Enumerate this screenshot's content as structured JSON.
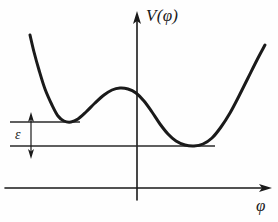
{
  "figure": {
    "background_color": "#fefefe",
    "ink_color": "#1a1a1a",
    "width": 278,
    "height": 222
  },
  "labels": {
    "y_axis": "V(φ)",
    "x_axis": "φ",
    "epsilon": "ε"
  },
  "icons": {
    "y_axis_arrow": "arrow-up-icon",
    "x_axis_arrow": "arrow-right-icon",
    "epsilon_arrow_top": "arrow-up-icon",
    "epsilon_arrow_bottom": "arrow-down-icon"
  },
  "chart_data": {
    "type": "line",
    "title": "",
    "xlabel": "φ",
    "ylabel": "V(φ)",
    "grid": false,
    "legend": null,
    "axes": {
      "origin_px": [
        137,
        188
      ],
      "y_axis_x_px": 137,
      "x_axis_y_px": 188,
      "x_axis_span_px": [
        5,
        272
      ],
      "y_axis_span_px": [
        12,
        200
      ],
      "arrows": [
        "x-right",
        "y-up"
      ]
    },
    "annotations": [
      {
        "name": "false-vacuum-level",
        "kind": "horizontal-line",
        "y_px": 122,
        "x_from_px": 10,
        "x_to_px": 80,
        "meaning": "energy level of local (false) minimum"
      },
      {
        "name": "true-vacuum-level",
        "kind": "horizontal-line",
        "y_px": 146,
        "x_from_px": 10,
        "x_to_px": 215,
        "meaning": "energy level of global (true) minimum"
      },
      {
        "name": "epsilon-dimension",
        "kind": "double-arrow",
        "label": "ε",
        "x_px": 31,
        "y_from_px": 113,
        "y_to_px": 158,
        "meaning": "energy difference between the two minima"
      }
    ],
    "curve": {
      "name": "asymmetric-double-well-potential",
      "stroke_width_px": 3,
      "points_px": [
        [
          30,
          35
        ],
        [
          34,
          52
        ],
        [
          39,
          70
        ],
        [
          45,
          89
        ],
        [
          52,
          105
        ],
        [
          58,
          116
        ],
        [
          64,
          121
        ],
        [
          71,
          122
        ],
        [
          78,
          119
        ],
        [
          86,
          112
        ],
        [
          95,
          103
        ],
        [
          104,
          95
        ],
        [
          112,
          90
        ],
        [
          120,
          88
        ],
        [
          128,
          89
        ],
        [
          136,
          93
        ],
        [
          144,
          101
        ],
        [
          152,
          112
        ],
        [
          160,
          124
        ],
        [
          168,
          134
        ],
        [
          176,
          141
        ],
        [
          185,
          145
        ],
        [
          194,
          146
        ],
        [
          203,
          144
        ],
        [
          212,
          138
        ],
        [
          221,
          127
        ],
        [
          230,
          113
        ],
        [
          239,
          96
        ],
        [
          248,
          78
        ],
        [
          257,
          60
        ],
        [
          265,
          45
        ]
      ],
      "features": [
        {
          "name": "local-minimum-left",
          "px": [
            68,
            122
          ],
          "type": "false vacuum"
        },
        {
          "name": "local-maximum-barrier",
          "px": [
            120,
            88
          ],
          "type": "barrier top"
        },
        {
          "name": "global-minimum-right",
          "px": [
            196,
            146
          ],
          "type": "true vacuum"
        }
      ]
    }
  }
}
